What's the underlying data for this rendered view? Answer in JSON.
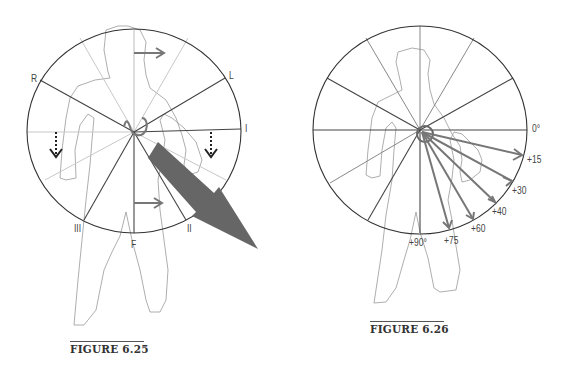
{
  "figure_625": {
    "caption": "FIGURE 6.25",
    "lead_labels": {
      "R": "R",
      "L": "L",
      "I": "I",
      "III": "III",
      "F": "F",
      "II": "II"
    },
    "elements": [
      "hexaxial-circle",
      "body-outline",
      "horizontal-arrow-top",
      "horizontal-arrow-bottom",
      "dotted-down-arrow-left",
      "dotted-down-arrow-right",
      "large-mean-vector-arrow",
      "loop-at-center"
    ]
  },
  "figure_626": {
    "caption": "FIGURE 6.26",
    "angle_labels": [
      {
        "id": "0",
        "label": "0°"
      },
      {
        "id": "15",
        "label": "+15"
      },
      {
        "id": "30",
        "label": "+30"
      },
      {
        "id": "40",
        "label": "+40"
      },
      {
        "id": "60",
        "label": "+60"
      },
      {
        "id": "75",
        "label": "+75"
      },
      {
        "id": "90",
        "label": "+90°"
      }
    ],
    "vector_angles_deg": [
      15,
      30,
      40,
      60,
      75
    ]
  }
}
